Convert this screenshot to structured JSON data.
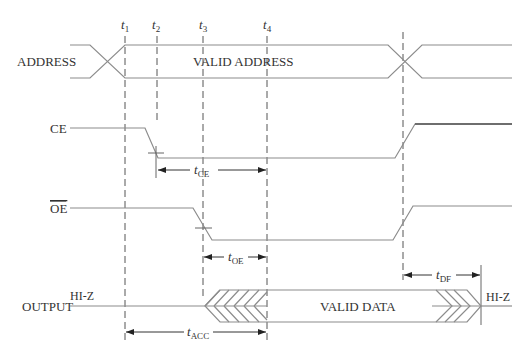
{
  "diagram": {
    "type": "timing-diagram",
    "time_markers": [
      {
        "label": "t",
        "sub": "1",
        "x": 125
      },
      {
        "label": "t",
        "sub": "2",
        "x": 157
      },
      {
        "label": "t",
        "sub": "3",
        "x": 203
      },
      {
        "label": "t",
        "sub": "4",
        "x": 267
      }
    ],
    "signals": {
      "address": {
        "name": "ADDRESS",
        "state_label": "VALID ADDRESS"
      },
      "ce": {
        "name": "CE"
      },
      "oe": {
        "name": "OE",
        "active_low": true
      },
      "output": {
        "name": "OUTPUT",
        "initial_state": "HI-Z",
        "data_label": "VALID DATA",
        "final_state": "HI-Z"
      }
    },
    "intervals": {
      "t_ce": {
        "label": "t",
        "sub": "CE",
        "from": "t2",
        "to": "t4"
      },
      "t_oe": {
        "label": "t",
        "sub": "OE",
        "from": "t3",
        "to": "t4"
      },
      "t_df": {
        "label": "t",
        "sub": "DF",
        "from": "address-change",
        "to": "output-hi-z"
      },
      "t_acc": {
        "label": "t",
        "sub": "ACC",
        "from": "t1",
        "to": "t4"
      }
    },
    "colors": {
      "signal_line": "#8c8c8c",
      "dashed_line": "#555555",
      "text": "#333333",
      "background": "#ffffff"
    }
  }
}
